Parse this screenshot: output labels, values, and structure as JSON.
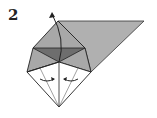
{
  "diagram": {
    "step_number": "2",
    "type": "origami-fold-step",
    "colors": {
      "paper_back": "#a9a9a9",
      "paper_dark": "#707070",
      "paper_front": "#ffffff",
      "line": "#222222"
    },
    "arrows": [
      "fold-up-arrow",
      "fold-left-arrow",
      "fold-right-arrow"
    ]
  }
}
